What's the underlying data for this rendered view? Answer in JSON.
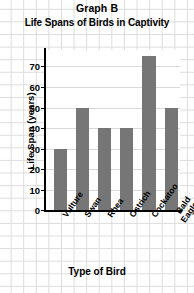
{
  "chart_data": {
    "type": "bar",
    "title": "Graph B",
    "subtitle": "Life Spans of Birds in Captivity",
    "xlabel": "Type of Bird",
    "ylabel": "Life Span (years)",
    "categories": [
      "Vulture",
      "Swan",
      "Rhea",
      "Ostrich",
      "Cockatoo",
      "Bald Eagle"
    ],
    "category_lines": [
      [
        "Vulture"
      ],
      [
        "Swan"
      ],
      [
        "Rhea"
      ],
      [
        "Ostrich"
      ],
      [
        "Cockatoo"
      ],
      [
        "Bald",
        "Eagle"
      ]
    ],
    "values": [
      30,
      50,
      40,
      40,
      75,
      50
    ],
    "ylim": [
      0,
      78
    ],
    "yticks": [
      0,
      10,
      20,
      30,
      40,
      50,
      60,
      70
    ],
    "ytick_labels": [
      "0",
      "10",
      "20",
      "30",
      "40",
      "50",
      "60",
      "70"
    ],
    "grid": true,
    "legend": null,
    "bar_color": "#767676",
    "axis_color": "#000000",
    "grid_color": "#d9d9d9",
    "background_color": "#ffffff"
  }
}
